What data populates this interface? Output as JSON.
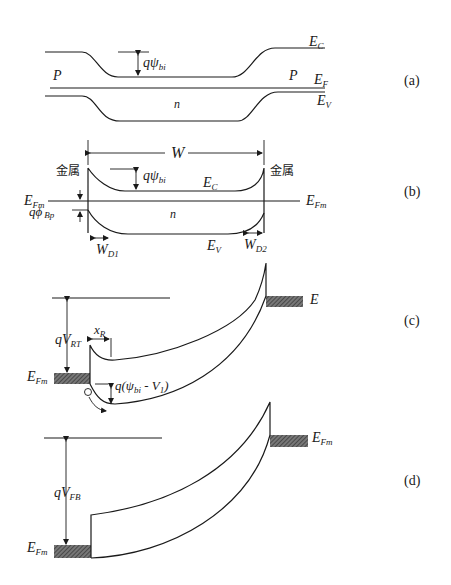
{
  "figure": {
    "panels": [
      {
        "id": "a",
        "label": "(a)",
        "texts": {
          "ec": "E",
          "ec_sub": "C",
          "ef": "E",
          "ef_sub": "F",
          "ev": "E",
          "ev_sub": "V",
          "p_left": "P",
          "p_right": "P",
          "n": "n",
          "qpsi": "qψ",
          "qpsi_sub": "bi"
        }
      },
      {
        "id": "b",
        "label": "(b)",
        "texts": {
          "w": "W",
          "metal_left": "金属",
          "metal_right": "金属",
          "qpsi": "qψ",
          "qpsi_sub": "bi",
          "ec": "E",
          "ec_sub": "C",
          "efm_left": "E",
          "efm_left_sub": "Fm",
          "efm_right": "E",
          "efm_right_sub": "Fm",
          "qphi": "qϕ",
          "qphi_sub": "Bp",
          "n": "n",
          "ev": "E",
          "ev_sub": "V",
          "wd1": "W",
          "wd1_sub": "D1",
          "wd2": "W",
          "wd2_sub": "D2"
        }
      },
      {
        "id": "c",
        "label": "(c)",
        "texts": {
          "qvrt": "qV",
          "qvrt_sub": "RT",
          "xr": "x",
          "xr_sub": "R",
          "efm_left": "E",
          "efm_left_sub": "Fm",
          "efm_right": "E",
          "efm_right_sub": "Fm",
          "qpsiv": "q(ψ",
          "qpsiv_sub1": "bi",
          "qpsiv_mid": " - V",
          "qpsiv_sub2": "1",
          "qpsiv_end": ")"
        }
      },
      {
        "id": "d",
        "label": "(d)",
        "texts": {
          "qvfb": "qV",
          "qvfb_sub": "FB",
          "efm_left": "E",
          "efm_left_sub": "Fm",
          "efm_right": "E",
          "efm_right_sub": "Fm"
        }
      }
    ]
  }
}
